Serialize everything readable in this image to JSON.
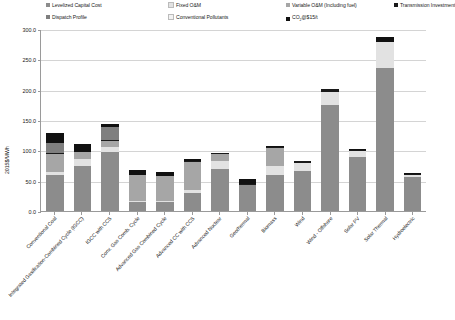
{
  "legend": {
    "items": [
      {
        "label": "Levelized Capital Cost",
        "color": "#8c8c8c",
        "row": 0,
        "col": 0
      },
      {
        "label": "Fixed O&M",
        "color": "#e2e2e2",
        "row": 0,
        "col": 1
      },
      {
        "label": "Variable O&M (Including fuel)",
        "color": "#a6a6a6",
        "row": 0,
        "col": 2
      },
      {
        "label": "Transmission Investment",
        "color": "#1a1a1a",
        "row": 0,
        "col": 3
      },
      {
        "label": "Dispatch Profile",
        "color": "#7f7f7f",
        "row": 1,
        "col": 0
      },
      {
        "label": "Conventional Pollutants",
        "color": "#f2f2f2",
        "row": 1,
        "col": 1
      },
      {
        "label": "CO2@$15/t",
        "color": "#111111",
        "row": 1,
        "col": 2
      }
    ]
  },
  "chart_data": {
    "type": "bar",
    "title": "",
    "xlabel": "",
    "ylabel": "2015$/MWh",
    "ylim": [
      0,
      300
    ],
    "ytick_labels": [
      "0.0",
      "50.0",
      "100.0",
      "150.0",
      "200.0",
      "250.0",
      "300.0"
    ],
    "ytick_values": [
      0,
      50,
      100,
      150,
      200,
      250,
      300
    ],
    "grid": true,
    "legend_position": "top",
    "stacked": true,
    "categories": [
      "Conventional Coal",
      "Integrated Gasification-Combined Cycle (IGCC)",
      "IGCC with CCS",
      "Conv. Gas Comb. Cycle",
      "Advanced Gas Combined Cycle",
      "Advanced CC with CCS",
      "Advanced Nuclear",
      "Geothermal",
      "Biomass",
      "Wind",
      "Wind - Offshore",
      "Solar PV",
      "Solar Thermal",
      "Hydroelectric"
    ],
    "series": [
      {
        "name": "Levelized Capital Cost",
        "color": "#8c8c8c",
        "values": [
          60,
          75,
          97,
          15,
          15,
          30,
          70,
          43,
          60,
          66,
          175,
          89,
          235,
          56
        ]
      },
      {
        "name": "Fixed O&M",
        "color": "#e2e2e2",
        "values": [
          4,
          10,
          9,
          2,
          2,
          4,
          12,
          0,
          14,
          13,
          22,
          10,
          43,
          4
        ]
      },
      {
        "name": "Variable O&M (Including fuel)",
        "color": "#a6a6a6",
        "values": [
          30,
          12,
          10,
          42,
          40,
          47,
          12,
          0,
          30,
          0,
          0,
          0,
          0,
          0
        ]
      },
      {
        "name": "Transmission Investment",
        "color": "#1a1a1a",
        "values": [
          1,
          1,
          1,
          1,
          1,
          1,
          1,
          1,
          1,
          3,
          4,
          1,
          1,
          1
        ]
      },
      {
        "name": "Dispatch Profile",
        "color": "#7f7f7f",
        "values": [
          18,
          0,
          22,
          0,
          0,
          0,
          0,
          0,
          0,
          0,
          0,
          0,
          0,
          0
        ]
      },
      {
        "name": "Conventional Pollutants",
        "color": "#f2f2f2",
        "values": [
          0,
          0,
          0,
          0,
          0,
          0,
          0,
          0,
          0,
          0,
          0,
          0,
          0,
          0
        ]
      },
      {
        "name": "CO2@$15/t",
        "color": "#111111",
        "values": [
          15,
          12,
          4,
          7,
          7,
          3,
          0,
          8,
          3,
          0,
          0,
          2,
          8,
          2
        ]
      }
    ],
    "totals": [
      128,
      110,
      143,
      67,
      65,
      85,
      95,
      52,
      108,
      82,
      201,
      102,
      287,
      63
    ]
  }
}
